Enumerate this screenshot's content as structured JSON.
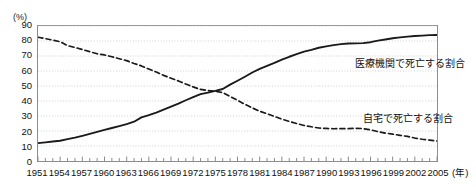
{
  "chart_data": {
    "type": "line",
    "title": "",
    "subtitle": "",
    "xlabel": "(年)",
    "ylabel": "(%)",
    "ylim": [
      0,
      90
    ],
    "xlim": [
      1951,
      2005
    ],
    "grid": true,
    "grid_axis": "y",
    "legend_position": "inline-annotation",
    "y_ticks": [
      0,
      10,
      20,
      30,
      40,
      50,
      60,
      70,
      80,
      90
    ],
    "y_tick_labels": [
      "0",
      "10",
      "20",
      "30",
      "40",
      "50",
      "60",
      "70",
      "80",
      "90"
    ],
    "x_ticks": [
      1951,
      1954,
      1957,
      1960,
      1963,
      1966,
      1969,
      1972,
      1975,
      1978,
      1981,
      1984,
      1987,
      1990,
      1993,
      1996,
      1999,
      2002,
      2005
    ],
    "x_tick_labels": [
      "1951",
      "1954",
      "1957",
      "1960",
      "1963",
      "1966",
      "1969",
      "1972",
      "1975",
      "1978",
      "1981",
      "1984",
      "1987",
      "1990",
      "1993",
      "1996",
      "1999",
      "2002",
      "2005"
    ],
    "x_minor_tick_interval": 1,
    "x_unit_label": "(年)",
    "y_unit_label": "(%)",
    "x": [
      1951,
      1952,
      1953,
      1954,
      1955,
      1956,
      1957,
      1958,
      1959,
      1960,
      1961,
      1962,
      1963,
      1964,
      1965,
      1966,
      1967,
      1968,
      1969,
      1970,
      1971,
      1972,
      1973,
      1974,
      1975,
      1976,
      1977,
      1978,
      1979,
      1980,
      1981,
      1982,
      1983,
      1984,
      1985,
      1986,
      1987,
      1988,
      1989,
      1990,
      1991,
      1992,
      1993,
      1994,
      1995,
      1996,
      1997,
      1998,
      1999,
      2000,
      2001,
      2002,
      2003,
      2004,
      2005
    ],
    "series": [
      {
        "name": "医療機関で死亡する割合",
        "style": "solid",
        "color": "#1a1a1a",
        "values": [
          11.9,
          12.4,
          13.0,
          13.5,
          14.6,
          15.6,
          16.8,
          18.1,
          19.4,
          20.7,
          22.0,
          23.3,
          24.6,
          26.2,
          29.1,
          30.6,
          32.3,
          34.3,
          36.3,
          38.3,
          40.5,
          42.6,
          44.6,
          45.6,
          46.7,
          48.0,
          50.9,
          53.5,
          56.2,
          59.0,
          61.4,
          63.4,
          65.4,
          67.6,
          69.5,
          71.2,
          72.9,
          74.1,
          75.5,
          76.4,
          77.2,
          77.9,
          78.3,
          78.4,
          78.6,
          79.2,
          80.3,
          81.0,
          81.8,
          82.4,
          82.9,
          83.3,
          83.6,
          83.9,
          84.0
        ],
        "start_value": 11.9,
        "end_value": 84.0,
        "annotation": "医療機関で死亡する割合"
      },
      {
        "name": "自宅で死亡する割合",
        "style": "dashed",
        "color": "#1a1a1a",
        "values": [
          82.5,
          81.6,
          80.6,
          79.5,
          76.9,
          75.7,
          74.3,
          72.9,
          71.5,
          70.7,
          69.5,
          68.2,
          66.9,
          65.0,
          63.4,
          61.3,
          59.3,
          57.1,
          55.2,
          53.4,
          51.3,
          49.4,
          47.7,
          47.0,
          46.5,
          45.6,
          43.0,
          40.4,
          37.8,
          35.4,
          33.2,
          31.5,
          29.7,
          27.9,
          26.4,
          25.0,
          23.7,
          22.8,
          22.0,
          21.7,
          21.5,
          21.6,
          21.6,
          21.8,
          21.6,
          20.8,
          19.6,
          18.6,
          17.9,
          17.1,
          16.4,
          15.3,
          14.5,
          13.9,
          13.3
        ],
        "start_value": 82.5,
        "end_value": 13.3,
        "annotation": "自宅で死亡する割合"
      }
    ],
    "crossover": {
      "year": 1976,
      "value": 48
    },
    "annotations": [
      {
        "id": "hospital",
        "text": "医療機関で死亡する割合"
      },
      {
        "id": "home",
        "text": "自宅で死亡する割合"
      }
    ]
  }
}
